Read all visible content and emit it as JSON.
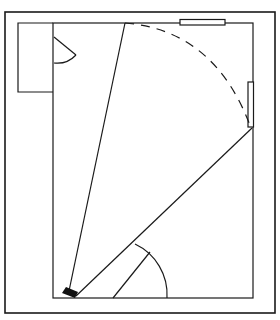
{
  "diagram": {
    "type": "floor-plan",
    "stroke_color": "#1a1a1a",
    "background_color": "#ffffff",
    "elements": {
      "outer_frame": {
        "x": 5,
        "y": 12,
        "width": 270,
        "height": 301
      },
      "room": {
        "x": 53,
        "y": 23,
        "width": 200,
        "height": 275
      },
      "alcove": {
        "x": 18,
        "y": 23,
        "width": 35,
        "height": 69
      },
      "top_window": {
        "x": 180,
        "y": 19,
        "width": 45,
        "height": 6
      },
      "right_window": {
        "x": 248,
        "y": 82,
        "width": 6,
        "height": 45
      },
      "camera": {
        "x": 62,
        "y": 289,
        "label": "camera"
      },
      "top_door_swing": {
        "hinge": [
          53,
          37
        ],
        "leaf_end": [
          76,
          55
        ],
        "arc_end": [
          53,
          63
        ]
      },
      "bottom_door_swing": {
        "hinge": [
          113,
          298
        ],
        "leaf_end": [
          149,
          253
        ],
        "arc_start": [
          135,
          244
        ],
        "arc_end": [
          167,
          298
        ]
      },
      "view_lines": [
        {
          "from": [
            70,
            292
          ],
          "to": [
            125,
            23
          ]
        },
        {
          "from": [
            75,
            296
          ],
          "to": [
            252,
            128
          ]
        }
      ],
      "view_arc": {
        "from": [
          125,
          23
        ],
        "to": [
          252,
          128
        ],
        "style": "dashed"
      }
    }
  }
}
